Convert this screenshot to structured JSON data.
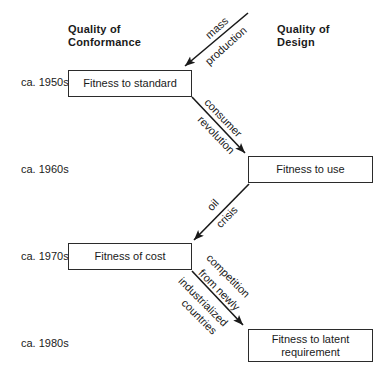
{
  "colors": {
    "ink": "#1a1a1a",
    "background": "#ffffff",
    "box_border": "#2b2b2b"
  },
  "headers": {
    "conformance": {
      "lines": [
        "Quality of",
        "Conformance"
      ]
    },
    "design": {
      "lines": [
        "Quality of",
        "Design"
      ]
    }
  },
  "eras": [
    {
      "label": "ca. 1950s"
    },
    {
      "label": "ca. 1960s"
    },
    {
      "label": "ca. 1970s"
    },
    {
      "label": "ca. 1980s"
    }
  ],
  "boxes": [
    {
      "label": "Fitness to standard"
    },
    {
      "label": "Fitness to use"
    },
    {
      "label": "Fitness of cost"
    },
    {
      "label": "Fitness to latent requirement"
    }
  ],
  "arrows": [
    {
      "name": "mass-production",
      "label_lines": [
        "mass",
        "production"
      ]
    },
    {
      "name": "consumer-revolution",
      "label_lines": [
        "consumer",
        "revolution"
      ]
    },
    {
      "name": "oil-crisis",
      "label_lines": [
        "oil",
        "crisis"
      ]
    },
    {
      "name": "competition-from-newly-industrialized-countries",
      "label_lines": [
        "competition",
        "from newly",
        "industrialized",
        "countries"
      ]
    }
  ]
}
